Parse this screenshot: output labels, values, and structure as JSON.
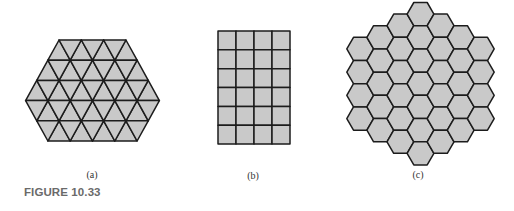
{
  "figure": {
    "caption": "FIGURE 10.33",
    "colors": {
      "background": "#ffffff",
      "tile_fill": "#c9c9c9",
      "tile_stroke": "#1c1c1c",
      "caption_text": "#6a6a6a",
      "label_text": "#333333"
    },
    "panels": [
      {
        "id": "a",
        "label": "(a)",
        "description": "Tiling of equilateral triangles",
        "shape": "triangle",
        "rows": [
          {
            "top_count": 4,
            "bottom_count": 4,
            "apex_row": true
          },
          {
            "top_count": 4,
            "bottom_count": 5
          },
          {
            "top_count": 5,
            "bottom_count": 6
          },
          {
            "top_count": 6,
            "bottom_count": 5
          },
          {
            "top_count": 5,
            "bottom_count": 4
          }
        ]
      },
      {
        "id": "b",
        "label": "(b)",
        "description": "Tiling of squares",
        "shape": "square",
        "columns": 4,
        "rows": 6
      },
      {
        "id": "c",
        "label": "(c)",
        "description": "Tiling of regular hexagons",
        "shape": "hexagon",
        "column_counts": [
          4,
          5,
          6,
          7,
          6,
          5,
          4
        ]
      }
    ]
  }
}
